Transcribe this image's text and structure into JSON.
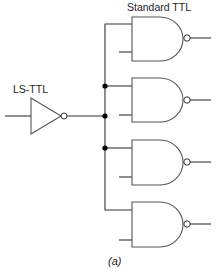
{
  "diagram": {
    "type": "logic-circuit-fanout",
    "labels": {
      "standard_ttl": "Standard TTL",
      "ls_ttl": "LS-TTL",
      "caption": "(a)"
    },
    "driver": {
      "kind": "inverter",
      "family": "LS-TTL"
    },
    "loads": [
      {
        "kind": "nand",
        "family": "Standard TTL",
        "index": 1
      },
      {
        "kind": "nand",
        "family": "Standard TTL",
        "index": 2
      },
      {
        "kind": "nand",
        "family": "Standard TTL",
        "index": 3
      },
      {
        "kind": "nand",
        "family": "Standard TTL",
        "index": 4
      }
    ],
    "junction_dots": 3,
    "colors": {
      "line": "#333333",
      "gate_outline": "#555555",
      "dot": "#000000",
      "background": "#ffffff"
    }
  }
}
